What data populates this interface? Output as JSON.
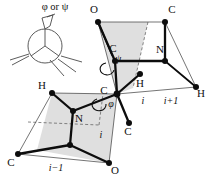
{
  "figure": {
    "caption": "φ or ψ",
    "background_color": "#ffffff",
    "plane_fill_color": "#d6d6d6",
    "bond_color": "#0d0d0d",
    "edge_color": "#3a3a3a"
  },
  "inset": {
    "name": "newman-projection",
    "label": "φ or ψ",
    "phi_symbol": "φ",
    "or_text": "or",
    "psi_symbol": "ψ"
  },
  "angles": [
    {
      "name": "psi",
      "symbol": "ψ",
      "x": 118,
      "y": 59
    },
    {
      "name": "phi",
      "symbol": "φ",
      "x": 110,
      "y": 104
    }
  ],
  "atoms": [
    {
      "id": "o-upper",
      "label": "O",
      "x": 94,
      "y": 13,
      "dot_x": 98,
      "dot_y": 22
    },
    {
      "id": "c-upper-right",
      "label": "C",
      "x": 172,
      "y": 13,
      "dot_x": 165,
      "dot_y": 22
    },
    {
      "id": "c-alpha-upper",
      "label": "C",
      "x": 113,
      "y": 52,
      "dot_x": 115,
      "dot_y": 61
    },
    {
      "id": "n-upper",
      "label": "N",
      "x": 160,
      "y": 53,
      "dot_x": 165,
      "dot_y": 61
    },
    {
      "id": "h-center",
      "label": "H",
      "x": 140,
      "y": 84,
      "dot_x": 140,
      "dot_y": 74
    },
    {
      "id": "h-right",
      "label": "H",
      "x": 199,
      "y": 96,
      "dot_x": 196,
      "dot_y": 87
    },
    {
      "id": "c-alpha-center",
      "label": "C",
      "x": 104,
      "y": 90,
      "dot_x": 117,
      "dot_y": 94
    },
    {
      "id": "c-side",
      "label": "C",
      "x": 128,
      "y": 133,
      "dot_x": 129,
      "dot_y": 123
    },
    {
      "id": "h-left",
      "label": "H",
      "x": 42,
      "y": 88,
      "dot_x": 52,
      "dot_y": 93
    },
    {
      "id": "n-lower",
      "label": "N",
      "x": 78,
      "y": 118,
      "dot_x": 73,
      "dot_y": 111
    },
    {
      "id": "c-lower-left",
      "label": "C",
      "x": 13,
      "y": 163,
      "dot_x": 18,
      "dot_y": 154
    },
    {
      "id": "o-lower",
      "label": "O",
      "x": 113,
      "y": 172,
      "dot_x": 109,
      "dot_y": 163
    },
    {
      "id": "c-lower-mid",
      "label": "",
      "x": 0,
      "y": 0,
      "dot_x": 70,
      "dot_y": 145
    }
  ],
  "residue_indices": [
    {
      "id": "index-i-upper",
      "label": "i",
      "x": 143,
      "y": 102
    },
    {
      "id": "index-i-plus-1",
      "label": "i+1",
      "x": 170,
      "y": 102
    },
    {
      "id": "index-i-lower",
      "label": "i",
      "x": 101,
      "y": 135
    },
    {
      "id": "index-i-minus-1",
      "label": "i−1",
      "x": 55,
      "y": 168
    }
  ],
  "planes": [
    {
      "id": "peptide-plane-upper",
      "fill": "#d6d6d6"
    },
    {
      "id": "peptide-plane-lower",
      "fill": "#d6d6d6"
    }
  ]
}
